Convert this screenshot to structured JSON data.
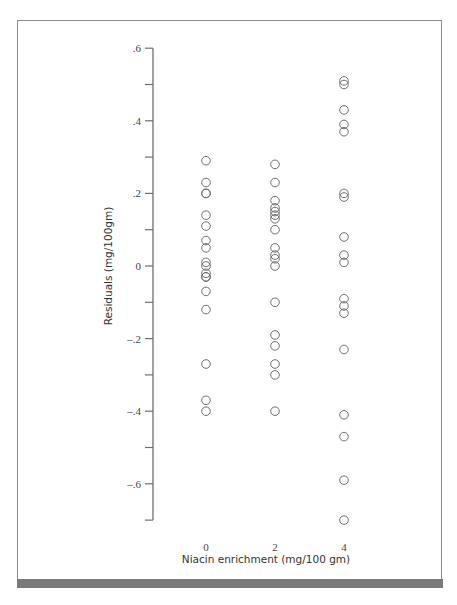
{
  "chart_data": {
    "type": "scatter",
    "title": "",
    "xlabel": "Niacin enrichment (mg/100 gm)",
    "ylabel": "Residuals (mg/100gm)",
    "x_ticks": [
      "0",
      "2",
      "4"
    ],
    "y_ticks": [
      ".6",
      ".4",
      ".2",
      "0",
      "-.2",
      "-.4",
      "-.6"
    ],
    "ylim": [
      -0.7,
      0.6
    ],
    "grid": false,
    "legend": null,
    "marker": "open-circle",
    "series": [
      {
        "name": "Niacin 0",
        "x": 0,
        "values": [
          0.29,
          0.23,
          0.2,
          0.2,
          0.14,
          0.11,
          0.07,
          0.05,
          0.01,
          0.0,
          -0.02,
          -0.03,
          -0.03,
          -0.07,
          -0.12,
          -0.27,
          -0.37,
          -0.4
        ]
      },
      {
        "name": "Niacin 2",
        "x": 2,
        "values": [
          0.28,
          0.23,
          0.18,
          0.16,
          0.15,
          0.14,
          0.13,
          0.1,
          0.05,
          0.03,
          0.02,
          0.0,
          -0.1,
          -0.19,
          -0.22,
          -0.27,
          -0.3,
          -0.4
        ]
      },
      {
        "name": "Niacin 4",
        "x": 4,
        "values": [
          0.51,
          0.5,
          0.43,
          0.39,
          0.37,
          0.2,
          0.19,
          0.08,
          0.03,
          0.01,
          -0.09,
          -0.11,
          -0.13,
          -0.23,
          -0.41,
          -0.47,
          -0.59,
          -0.7
        ]
      }
    ]
  },
  "colors": {
    "marker_stroke": "#6e6e6e",
    "axis": "#6e6e6e",
    "frame": "#8a8a8a",
    "bottom_bar": "#7a7a7a"
  }
}
